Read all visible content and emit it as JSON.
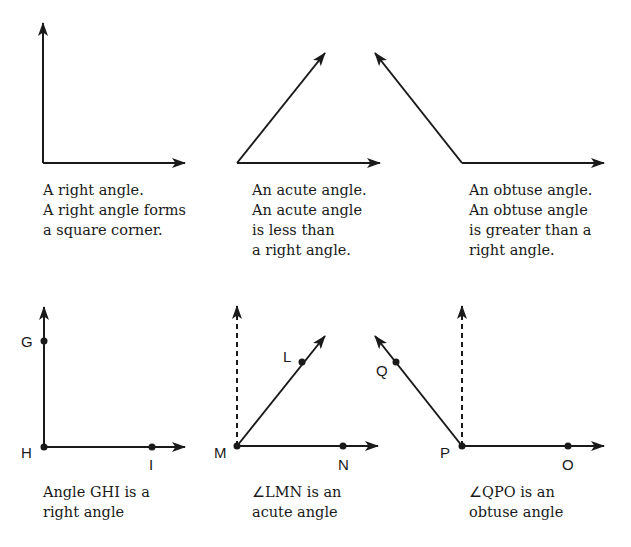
{
  "figure": {
    "type": "angle-types-diagram",
    "top_row": [
      {
        "id": "right",
        "caption_lines": [
          "A right angle.",
          "A right angle forms",
          "a square corner."
        ]
      },
      {
        "id": "acute",
        "caption_lines": [
          "An acute angle.",
          "An acute angle",
          "is less than",
          "a right angle."
        ]
      },
      {
        "id": "obtuse",
        "caption_lines": [
          "An obtuse angle.",
          "An obtuse angle",
          "is greater than a",
          "right angle."
        ]
      }
    ],
    "bottom_row": [
      {
        "id": "ghi",
        "points": {
          "ray1": "G",
          "vertex": "H",
          "ray2": "I"
        },
        "reference_dashed_line": false,
        "caption_prefix": "",
        "caption_line1": "Angle GHI  is a",
        "caption_line2": "right angle"
      },
      {
        "id": "lmn",
        "points": {
          "ray1": "L",
          "vertex": "M",
          "ray2": "N"
        },
        "reference_dashed_line": true,
        "caption_prefix": "∠",
        "caption_line1": "LMN  is an",
        "caption_line2": "acute angle"
      },
      {
        "id": "qpo",
        "points": {
          "ray1": "Q",
          "vertex": "P",
          "ray2": "O"
        },
        "reference_dashed_line": true,
        "caption_prefix": "∠",
        "caption_line1": "QPO  is an",
        "caption_line2": "obtuse angle"
      }
    ],
    "colors": {
      "stroke": "#1a1a1a",
      "background": "#ffffff"
    }
  }
}
